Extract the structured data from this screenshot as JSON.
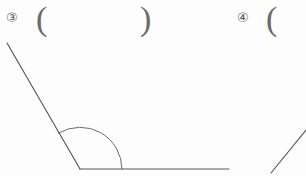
{
  "page": {
    "background_color": "#fdfdfd",
    "ink_color": "#575757",
    "width": 306,
    "height": 176
  },
  "problems": [
    {
      "id": "problem-3",
      "marker": "③",
      "open_paren": "(",
      "close_paren": ")",
      "answer_value": "",
      "figure": {
        "type": "angle",
        "vertex": [
          80,
          169
        ],
        "ray_upper_end": [
          7,
          43
        ],
        "ray_horizontal_end": [
          229,
          169
        ],
        "arc_radius": 42,
        "arc_label": ""
      }
    },
    {
      "id": "problem-4",
      "marker": "④",
      "open_paren": "(",
      "close_paren": "",
      "answer_value": "",
      "figure": {
        "type": "partial-ray",
        "start": [
          271,
          173
        ],
        "end": [
          306,
          130
        ]
      }
    }
  ]
}
